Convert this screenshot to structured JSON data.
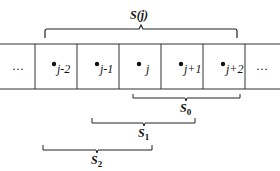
{
  "diagram": {
    "top_brace": {
      "label_main": "S",
      "label_arg": "(j)"
    },
    "cells": [
      {
        "label": "…",
        "dot": false
      },
      {
        "label": "j-2",
        "dot": true
      },
      {
        "label": "j-1",
        "dot": true
      },
      {
        "label": "j",
        "dot": true
      },
      {
        "label": "j+1",
        "dot": true
      },
      {
        "label": "j+2",
        "dot": true
      },
      {
        "label": "…",
        "dot": false
      }
    ],
    "braces": [
      {
        "main": "S",
        "sub": "0"
      },
      {
        "main": "S",
        "sub": "1"
      },
      {
        "main": "S",
        "sub": "2"
      }
    ]
  }
}
